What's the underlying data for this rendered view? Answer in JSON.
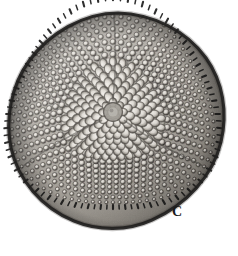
{
  "figure": {
    "panel_label": "C",
    "background_color": "#ffffff",
    "image_type": "grayscale light micrograph",
    "subject": "triangular diatom valve (areolate frustule, valve view)",
    "width_px": 238,
    "height_px": 256
  },
  "specimen": {
    "outline_shape": "rounded triangle",
    "center_x": 113,
    "center_y": 114,
    "apex_top": {
      "x": 118,
      "y": 13
    },
    "apex_left": {
      "x": 10,
      "y": 176
    },
    "apex_right": {
      "x": 221,
      "y": 168
    },
    "widest_extent_px": 217,
    "tallest_extent_px": 216,
    "rim_color": "#1d1d1d",
    "wall_color": "#55514e",
    "areola_light_color": "#d8d5d0",
    "valve_face_color": "#9a968f",
    "shadow_color": "#3b3834",
    "highlight_color": "#efece7"
  },
  "structures": {
    "central_annulus": {
      "name": "central annulus",
      "x": 113,
      "y": 112,
      "radius_px": 9,
      "color": "#8d8983"
    },
    "radial_rays": {
      "name": "radial hyaline lines",
      "count": 3,
      "angles_deg": [
        -90,
        30,
        150
      ],
      "color": "#4a4743"
    },
    "central_areolae": {
      "name": "central polygonal areolae",
      "zone": "center",
      "approx_count": 70,
      "mean_diameter_px": 11,
      "pattern": "radial polygonal"
    },
    "marginal_areolae": {
      "name": "marginal circular areolae",
      "zone": "margin",
      "approx_count": 520,
      "mean_diameter_px": 5,
      "pattern": "radial rows"
    },
    "marginal_rim": {
      "name": "crenulated marginal rim",
      "thickness_px": 5,
      "spine_count": 96,
      "color": "#121212"
    }
  },
  "tones": {
    "background": "#ffffff",
    "darkest": "#101010",
    "mid_gray": "#8b8781",
    "lightest_internal": "#efece8"
  }
}
